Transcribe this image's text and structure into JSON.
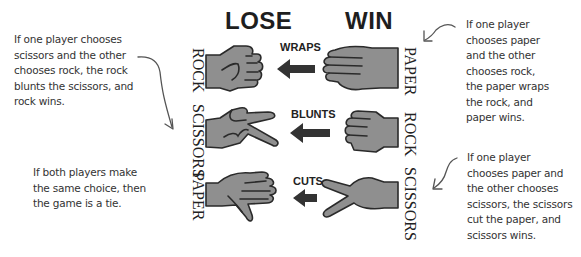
{
  "headers": {
    "lose": "LOSE",
    "win": "WIN"
  },
  "rows": [
    {
      "loser": "ROCK",
      "verb": "WRAPS",
      "winner": "PAPER",
      "loser_icon": "rock-fist-icon",
      "winner_icon": "paper-hand-icon"
    },
    {
      "loser": "SCISSORS",
      "verb": "BLUNTS",
      "winner": "ROCK",
      "loser_icon": "scissors-hand-icon",
      "winner_icon": "rock-fist-icon"
    },
    {
      "loser": "PAPER",
      "verb": "CUTS",
      "winner": "SCISSORS",
      "loser_icon": "paper-hand-icon",
      "winner_icon": "scissors-hand-icon"
    }
  ],
  "notes": {
    "rock_vs_scissors": "If one player chooses\nscissors and the other\nchooses rock, the rock\nblunts the scissors, and\nrock wins.",
    "tie": "If both players make\nthe same choice, then\nthe game is a tie.",
    "paper_vs_rock": "If one player\nchooses paper\nand the other\nchooses rock,\nthe paper wraps\nthe rock, and\npaper wins.",
    "scissors_vs_paper": "If one player\nchooses paper and\nthe other chooses\nscissors, the scissors\ncut the paper, and\nscissors wins."
  },
  "colors": {
    "hand_fill": "#8f8f8f",
    "outline": "#2a2a2a",
    "text": "#222222",
    "note_text": "#333333"
  }
}
